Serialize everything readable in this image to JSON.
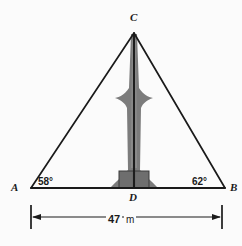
{
  "figure": {
    "kind": "geometry-diagram",
    "background_color": "#fbfbfb",
    "line_color": "#1a1a1a",
    "tower_color": "#7a7a7a",
    "tower_edge_color": "#2b2b2b",
    "vertices": [
      {
        "name": "C",
        "label": "C",
        "x": 134,
        "y": 33
      },
      {
        "name": "A",
        "label": "A",
        "x": 31,
        "y": 188
      },
      {
        "name": "B",
        "label": "B",
        "x": 225,
        "y": 188
      },
      {
        "name": "D",
        "label": "D",
        "x": 134,
        "y": 188
      }
    ],
    "angles": [
      {
        "at": "A",
        "label": "58°",
        "value": 58,
        "unit": "degrees"
      },
      {
        "at": "B",
        "label": "62°",
        "value": 62,
        "unit": "degrees"
      }
    ],
    "dimension": {
      "from": "A",
      "to": "B",
      "value": "47",
      "unit": "m",
      "label": "47 m",
      "arrow_style": "double-headed-with-end-ticks"
    }
  }
}
